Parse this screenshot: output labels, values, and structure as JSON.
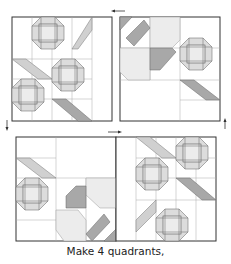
{
  "figure": {
    "caption": "Make 4 quadrants,",
    "colors": {
      "background": "#ffffff",
      "outline": "#333333",
      "grid_line": "#999999",
      "light_fabric": "#e6e6e6",
      "medium_fabric": "#c8c8c8",
      "dark_fabric": "#999999",
      "arrow": "#333333"
    },
    "quadrants": [
      {
        "id": "top-left",
        "label": "Quadrant 1"
      },
      {
        "id": "top-right",
        "label": "Quadrant 2"
      },
      {
        "id": "bottom-left",
        "label": "Quadrant 3"
      },
      {
        "id": "bottom-right",
        "label": "Quadrant 4"
      }
    ],
    "arrows": [
      {
        "position": "top-center",
        "direction": "left"
      },
      {
        "position": "left-middle",
        "direction": "down"
      },
      {
        "position": "center-middle",
        "direction": "right"
      },
      {
        "position": "right-middle",
        "direction": "up"
      }
    ]
  }
}
